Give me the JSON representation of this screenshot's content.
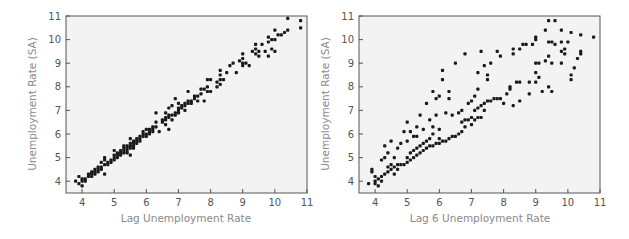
{
  "chart_data": [
    {
      "type": "scatter",
      "title": "",
      "xlabel": "Lag Unemployment Rate",
      "ylabel": "Unemployment Rate (SA)",
      "xlim": [
        3.5,
        11
      ],
      "ylim": [
        3.5,
        11
      ],
      "xticks": [
        4,
        5,
        6,
        7,
        8,
        9,
        10,
        11
      ],
      "yticks": [
        4,
        5,
        6,
        7,
        8,
        9,
        10,
        11
      ],
      "grid": false,
      "legend": null,
      "points": [
        [
          3.8,
          4.0
        ],
        [
          3.9,
          3.9
        ],
        [
          3.9,
          4.2
        ],
        [
          4.0,
          3.8
        ],
        [
          4.0,
          4.1
        ],
        [
          4.0,
          4.0
        ],
        [
          4.1,
          4.1
        ],
        [
          4.1,
          4.0
        ],
        [
          4.2,
          4.2
        ],
        [
          4.2,
          4.3
        ],
        [
          4.3,
          4.2
        ],
        [
          4.3,
          4.3
        ],
        [
          4.3,
          4.4
        ],
        [
          4.4,
          4.4
        ],
        [
          4.4,
          4.5
        ],
        [
          4.4,
          4.3
        ],
        [
          4.5,
          4.5
        ],
        [
          4.5,
          4.6
        ],
        [
          4.5,
          4.4
        ],
        [
          4.6,
          4.6
        ],
        [
          4.6,
          4.5
        ],
        [
          4.6,
          4.8
        ],
        [
          4.7,
          4.7
        ],
        [
          4.7,
          4.9
        ],
        [
          4.7,
          4.3
        ],
        [
          4.7,
          5.0
        ],
        [
          4.8,
          4.8
        ],
        [
          4.8,
          4.7
        ],
        [
          4.9,
          4.9
        ],
        [
          4.9,
          4.8
        ],
        [
          5.0,
          5.0
        ],
        [
          5.0,
          5.1
        ],
        [
          5.0,
          5.3
        ],
        [
          5.0,
          4.9
        ],
        [
          5.1,
          5.1
        ],
        [
          5.1,
          5.0
        ],
        [
          5.1,
          5.2
        ],
        [
          5.2,
          5.2
        ],
        [
          5.2,
          5.3
        ],
        [
          5.2,
          5.1
        ],
        [
          5.3,
          5.3
        ],
        [
          5.3,
          5.4
        ],
        [
          5.3,
          5.2
        ],
        [
          5.3,
          5.5
        ],
        [
          5.4,
          5.4
        ],
        [
          5.4,
          5.3
        ],
        [
          5.4,
          5.5
        ],
        [
          5.4,
          5.2
        ],
        [
          5.5,
          5.5
        ],
        [
          5.5,
          5.4
        ],
        [
          5.5,
          5.6
        ],
        [
          5.5,
          5.8
        ],
        [
          5.5,
          5.1
        ],
        [
          5.6,
          5.6
        ],
        [
          5.6,
          5.5
        ],
        [
          5.6,
          5.7
        ],
        [
          5.6,
          5.4
        ],
        [
          5.7,
          5.7
        ],
        [
          5.7,
          5.6
        ],
        [
          5.7,
          5.8
        ],
        [
          5.8,
          5.8
        ],
        [
          5.8,
          5.9
        ],
        [
          5.8,
          5.7
        ],
        [
          5.9,
          5.9
        ],
        [
          5.9,
          6.0
        ],
        [
          5.9,
          6.1
        ],
        [
          6.0,
          6.0
        ],
        [
          6.0,
          5.9
        ],
        [
          6.0,
          6.2
        ],
        [
          6.1,
          6.1
        ],
        [
          6.1,
          6.2
        ],
        [
          6.1,
          6.0
        ],
        [
          6.2,
          6.2
        ],
        [
          6.2,
          6.3
        ],
        [
          6.2,
          6.1
        ],
        [
          6.3,
          6.3
        ],
        [
          6.3,
          6.9
        ],
        [
          6.3,
          6.5
        ],
        [
          6.4,
          6.1
        ],
        [
          6.5,
          6.6
        ],
        [
          6.5,
          6.5
        ],
        [
          6.6,
          6.6
        ],
        [
          6.6,
          6.7
        ],
        [
          6.6,
          6.4
        ],
        [
          6.6,
          6.9
        ],
        [
          6.7,
          6.7
        ],
        [
          6.7,
          6.8
        ],
        [
          6.7,
          6.2
        ],
        [
          6.7,
          7.1
        ],
        [
          6.8,
          6.8
        ],
        [
          6.8,
          6.6
        ],
        [
          6.8,
          7.2
        ],
        [
          6.9,
          6.9
        ],
        [
          6.9,
          6.8
        ],
        [
          6.9,
          7.5
        ],
        [
          7.0,
          7.0
        ],
        [
          7.0,
          7.1
        ],
        [
          7.0,
          6.9
        ],
        [
          7.0,
          7.3
        ],
        [
          7.1,
          7.1
        ],
        [
          7.1,
          7.2
        ],
        [
          7.2,
          7.2
        ],
        [
          7.2,
          7.3
        ],
        [
          7.2,
          7.0
        ],
        [
          7.3,
          7.3
        ],
        [
          7.3,
          7.4
        ],
        [
          7.3,
          7.8
        ],
        [
          7.4,
          7.4
        ],
        [
          7.4,
          7.3
        ],
        [
          7.5,
          7.5
        ],
        [
          7.5,
          7.6
        ],
        [
          7.6,
          7.6
        ],
        [
          7.6,
          7.4
        ],
        [
          7.7,
          7.7
        ],
        [
          7.7,
          7.9
        ],
        [
          7.8,
          7.9
        ],
        [
          7.8,
          7.4
        ],
        [
          7.9,
          8.0
        ],
        [
          7.9,
          7.8
        ],
        [
          7.9,
          8.3
        ],
        [
          8.0,
          8.3
        ],
        [
          8.0,
          7.8
        ],
        [
          8.2,
          8.2
        ],
        [
          8.2,
          8.0
        ],
        [
          8.3,
          8.3
        ],
        [
          8.3,
          8.5
        ],
        [
          8.3,
          8.7
        ],
        [
          8.3,
          8.1
        ],
        [
          8.4,
          8.3
        ],
        [
          8.5,
          8.6
        ],
        [
          8.6,
          8.9
        ],
        [
          8.7,
          9.0
        ],
        [
          8.8,
          8.6
        ],
        [
          8.9,
          9.1
        ],
        [
          9.0,
          9.0
        ],
        [
          9.0,
          9.2
        ],
        [
          9.0,
          9.4
        ],
        [
          9.0,
          8.9
        ],
        [
          9.1,
          9.0
        ],
        [
          9.2,
          8.9
        ],
        [
          9.3,
          9.5
        ],
        [
          9.4,
          9.4
        ],
        [
          9.4,
          9.6
        ],
        [
          9.4,
          9.8
        ],
        [
          9.5,
          9.5
        ],
        [
          9.5,
          9.3
        ],
        [
          9.6,
          9.8
        ],
        [
          9.7,
          9.5
        ],
        [
          9.8,
          9.9
        ],
        [
          9.8,
          10.1
        ],
        [
          9.8,
          9.3
        ],
        [
          9.9,
          10.0
        ],
        [
          9.9,
          9.6
        ],
        [
          10.0,
          10.0
        ],
        [
          10.0,
          10.4
        ],
        [
          10.0,
          9.5
        ],
        [
          10.1,
          10.2
        ],
        [
          10.2,
          10.2
        ],
        [
          10.3,
          10.3
        ],
        [
          10.4,
          10.4
        ],
        [
          10.4,
          10.9
        ],
        [
          10.8,
          10.8
        ],
        [
          10.8,
          10.5
        ]
      ]
    },
    {
      "type": "scatter",
      "title": "",
      "xlabel": "Lag 6 Unemployment Rate",
      "ylabel": "Unemployment Rate (SA)",
      "xlim": [
        3.5,
        11
      ],
      "ylim": [
        3.5,
        11
      ],
      "xticks": [
        4,
        5,
        6,
        7,
        8,
        9,
        10,
        11
      ],
      "yticks": [
        4,
        5,
        6,
        7,
        8,
        9,
        10,
        11
      ],
      "grid": false,
      "legend": null,
      "points": [
        [
          3.8,
          3.9
        ],
        [
          3.9,
          4.4
        ],
        [
          3.9,
          4.5
        ],
        [
          4.0,
          4.0
        ],
        [
          4.0,
          3.9
        ],
        [
          4.0,
          4.2
        ],
        [
          4.1,
          3.8
        ],
        [
          4.1,
          4.1
        ],
        [
          4.2,
          4.0
        ],
        [
          4.2,
          4.2
        ],
        [
          4.2,
          4.9
        ],
        [
          4.3,
          4.3
        ],
        [
          4.3,
          5.5
        ],
        [
          4.3,
          5.0
        ],
        [
          4.4,
          4.4
        ],
        [
          4.4,
          4.6
        ],
        [
          4.4,
          5.2
        ],
        [
          4.5,
          4.5
        ],
        [
          4.5,
          4.7
        ],
        [
          4.5,
          5.7
        ],
        [
          4.6,
          4.6
        ],
        [
          4.6,
          4.3
        ],
        [
          4.6,
          5.0
        ],
        [
          4.7,
          4.7
        ],
        [
          4.7,
          4.5
        ],
        [
          4.7,
          5.4
        ],
        [
          4.8,
          4.7
        ],
        [
          4.8,
          5.6
        ],
        [
          4.9,
          4.7
        ],
        [
          4.9,
          6.1
        ],
        [
          5.0,
          4.8
        ],
        [
          5.0,
          5.0
        ],
        [
          5.0,
          6.5
        ],
        [
          5.0,
          5.7
        ],
        [
          5.1,
          4.9
        ],
        [
          5.1,
          5.2
        ],
        [
          5.1,
          6.1
        ],
        [
          5.2,
          5.0
        ],
        [
          5.2,
          5.3
        ],
        [
          5.2,
          5.9
        ],
        [
          5.3,
          5.1
        ],
        [
          5.3,
          5.4
        ],
        [
          5.3,
          6.3
        ],
        [
          5.3,
          5.9
        ],
        [
          5.4,
          5.2
        ],
        [
          5.4,
          5.5
        ],
        [
          5.4,
          6.8
        ],
        [
          5.5,
          5.3
        ],
        [
          5.5,
          5.6
        ],
        [
          5.5,
          6.2
        ],
        [
          5.6,
          5.4
        ],
        [
          5.6,
          5.7
        ],
        [
          5.6,
          7.3
        ],
        [
          5.7,
          5.5
        ],
        [
          5.7,
          5.8
        ],
        [
          5.7,
          6.6
        ],
        [
          5.8,
          5.5
        ],
        [
          5.8,
          6.0
        ],
        [
          5.8,
          7.8
        ],
        [
          5.8,
          6.3
        ],
        [
          5.9,
          5.6
        ],
        [
          5.9,
          7.5
        ],
        [
          5.9,
          6.8
        ],
        [
          6.0,
          5.6
        ],
        [
          6.0,
          5.8
        ],
        [
          6.0,
          7.6
        ],
        [
          6.0,
          6.2
        ],
        [
          6.1,
          5.7
        ],
        [
          6.1,
          8.7
        ],
        [
          6.1,
          8.3
        ],
        [
          6.2,
          5.7
        ],
        [
          6.2,
          6.9
        ],
        [
          6.3,
          5.8
        ],
        [
          6.3,
          7.8
        ],
        [
          6.3,
          7.5
        ],
        [
          6.4,
          5.9
        ],
        [
          6.4,
          6.8
        ],
        [
          6.5,
          5.9
        ],
        [
          6.5,
          9.0
        ],
        [
          6.6,
          6.0
        ],
        [
          6.6,
          6.9
        ],
        [
          6.7,
          6.1
        ],
        [
          6.7,
          6.5
        ],
        [
          6.7,
          7.0
        ],
        [
          6.8,
          6.6
        ],
        [
          6.8,
          9.4
        ],
        [
          6.8,
          6.3
        ],
        [
          6.9,
          6.6
        ],
        [
          6.9,
          7.3
        ],
        [
          7.0,
          6.7
        ],
        [
          7.0,
          7.4
        ],
        [
          7.0,
          6.4
        ],
        [
          7.1,
          6.6
        ],
        [
          7.1,
          7.0
        ],
        [
          7.1,
          7.6
        ],
        [
          7.2,
          6.7
        ],
        [
          7.2,
          7.1
        ],
        [
          7.2,
          7.9
        ],
        [
          7.2,
          8.6
        ],
        [
          7.3,
          7.2
        ],
        [
          7.3,
          6.7
        ],
        [
          7.3,
          9.5
        ],
        [
          7.4,
          7.3
        ],
        [
          7.4,
          7.0
        ],
        [
          7.4,
          8.9
        ],
        [
          7.5,
          7.4
        ],
        [
          7.5,
          8.5
        ],
        [
          7.5,
          8.3
        ],
        [
          7.6,
          7.4
        ],
        [
          7.6,
          9.0
        ],
        [
          7.7,
          7.5
        ],
        [
          7.8,
          7.5
        ],
        [
          7.8,
          9.5
        ],
        [
          7.9,
          7.5
        ],
        [
          7.9,
          9.3
        ],
        [
          8.0,
          7.3
        ],
        [
          8.1,
          7.7
        ],
        [
          8.2,
          7.9
        ],
        [
          8.2,
          8.0
        ],
        [
          8.3,
          7.2
        ],
        [
          8.3,
          9.6
        ],
        [
          8.3,
          9.4
        ],
        [
          8.4,
          8.2
        ],
        [
          8.5,
          7.4
        ],
        [
          8.5,
          8.2
        ],
        [
          8.5,
          9.6
        ],
        [
          8.6,
          9.8
        ],
        [
          8.7,
          9.8
        ],
        [
          8.8,
          7.7
        ],
        [
          8.8,
          8.2
        ],
        [
          8.9,
          9.8
        ],
        [
          9.0,
          8.2
        ],
        [
          9.0,
          8.6
        ],
        [
          9.0,
          9.0
        ],
        [
          9.0,
          10.0
        ],
        [
          9.0,
          10.1
        ],
        [
          9.1,
          8.4
        ],
        [
          9.1,
          9.0
        ],
        [
          9.2,
          7.8
        ],
        [
          9.3,
          9.1
        ],
        [
          9.3,
          10.4
        ],
        [
          9.4,
          8.0
        ],
        [
          9.4,
          9.3
        ],
        [
          9.4,
          9.9
        ],
        [
          9.4,
          10.8
        ],
        [
          9.5,
          7.8
        ],
        [
          9.5,
          9.0
        ],
        [
          9.5,
          9.9
        ],
        [
          9.6,
          10.8
        ],
        [
          9.6,
          9.8
        ],
        [
          9.8,
          9.0
        ],
        [
          9.8,
          9.5
        ],
        [
          9.8,
          10.4
        ],
        [
          9.8,
          9.9
        ],
        [
          9.9,
          9.4
        ],
        [
          9.9,
          9.6
        ],
        [
          10.0,
          9.9
        ],
        [
          10.1,
          10.3
        ],
        [
          10.1,
          8.5
        ],
        [
          10.1,
          8.3
        ],
        [
          10.2,
          8.8
        ],
        [
          10.3,
          9.2
        ],
        [
          10.4,
          9.4
        ],
        [
          10.4,
          9.5
        ],
        [
          10.4,
          10.2
        ],
        [
          10.8,
          10.1
        ]
      ]
    }
  ],
  "figure": {
    "colors": {
      "plot_background": "#f3f3f3",
      "frame": "#555555",
      "point": "#1a1a1a",
      "tick_label": "#555555",
      "axis_label": "#8a8a8a"
    }
  }
}
